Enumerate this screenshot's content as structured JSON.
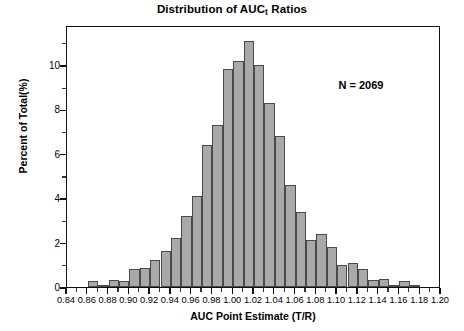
{
  "chart_data": {
    "type": "bar",
    "title": "Distribution of AUC",
    "title_subscript": "t",
    "title_suffix": " Ratios",
    "title_full": "Distribution of AUCt Ratios",
    "xlabel": "AUC Point Estimate (T/R)",
    "ylabel": "Percent of Total(%)",
    "xlim": [
      0.84,
      1.2
    ],
    "ylim": [
      0,
      11.8
    ],
    "bin_width": 0.01,
    "grid": false,
    "legend": null,
    "annotations": [
      {
        "text": "N = 2069",
        "x": 1.135,
        "y": 9.1
      }
    ],
    "x_tick_labels": [
      "0.84",
      "0.86",
      "0.88",
      "0.90",
      "0.92",
      "0.94",
      "0.96",
      "0.98",
      "1.00",
      "1.02",
      "1.04",
      "1.06",
      "1.08",
      "1.10",
      "1.12",
      "1.14",
      "1.16",
      "1.18",
      "1.20"
    ],
    "x_tick_values": [
      0.84,
      0.86,
      0.88,
      0.9,
      0.92,
      0.94,
      0.96,
      0.98,
      1.0,
      1.02,
      1.04,
      1.06,
      1.08,
      1.1,
      1.12,
      1.14,
      1.16,
      1.18,
      1.2
    ],
    "x_minor_tick_values": [
      0.85,
      0.87,
      0.89,
      0.91,
      0.93,
      0.95,
      0.97,
      0.99,
      1.01,
      1.03,
      1.05,
      1.07,
      1.09,
      1.11,
      1.13,
      1.15,
      1.17,
      1.19
    ],
    "y_tick_labels": [
      "0",
      "2",
      "4",
      "6",
      "8",
      "10"
    ],
    "y_tick_values": [
      0,
      2,
      4,
      6,
      8,
      10
    ],
    "y_minor_tick_values": [
      1,
      3,
      5,
      7,
      9,
      11
    ],
    "bar_fill_color": "#a9a9a9",
    "bar_edge_color": "#4a4a4a",
    "axis_color": "#111111",
    "bins": [
      0.85,
      0.86,
      0.87,
      0.88,
      0.89,
      0.9,
      0.91,
      0.92,
      0.93,
      0.94,
      0.95,
      0.96,
      0.97,
      0.98,
      0.99,
      1.0,
      1.01,
      1.02,
      1.03,
      1.04,
      1.05,
      1.06,
      1.07,
      1.08,
      1.09,
      1.1,
      1.11,
      1.12,
      1.13,
      1.14,
      1.15,
      1.16,
      1.17,
      1.18
    ],
    "values": [
      0.0,
      0.25,
      0.1,
      0.3,
      0.25,
      0.8,
      0.85,
      1.2,
      1.6,
      2.2,
      3.2,
      4.1,
      6.4,
      7.3,
      9.8,
      10.2,
      11.1,
      10.0,
      8.3,
      6.8,
      4.6,
      3.4,
      2.1,
      2.4,
      1.8,
      1.0,
      1.1,
      0.8,
      0.3,
      0.35,
      0.1,
      0.25,
      0.1,
      0.0
    ]
  },
  "figure": {
    "annotation_label": "N = 2069"
  }
}
